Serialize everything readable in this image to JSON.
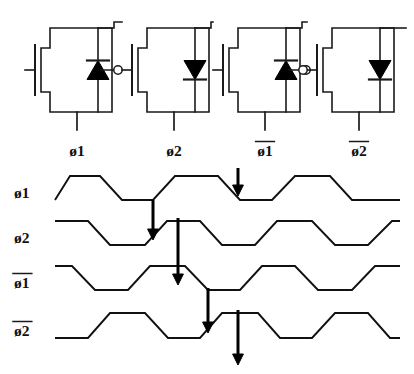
{
  "figure": {
    "background_color": "#ffffff",
    "ink_color": "#111111"
  },
  "circuit": {
    "name": "four-stage-clock-driver",
    "description": "Four cascaded MOS inverter stages with bootstrap diodes",
    "stages": [
      {
        "id": "stage-1",
        "output_label": "ø1",
        "diode_direction": "up",
        "diode_name": "diode-up-icon",
        "has_input_bubble": false,
        "has_output_bubble": true,
        "x": 50
      },
      {
        "id": "stage-2",
        "output_label": "ø2",
        "diode_direction": "down",
        "diode_name": "diode-down-icon",
        "has_input_bubble": false,
        "has_output_bubble": false,
        "x": 147
      },
      {
        "id": "stage-3",
        "output_label": "ø1",
        "output_label_overbar": true,
        "diode_direction": "up",
        "diode_name": "diode-up-icon",
        "has_input_bubble": false,
        "has_output_bubble": true,
        "x": 238
      },
      {
        "id": "stage-4",
        "output_label": "ø2",
        "output_label_overbar": true,
        "diode_direction": "down",
        "diode_name": "diode-down-icon",
        "has_input_bubble": true,
        "has_output_bubble": false,
        "x": 332
      }
    ],
    "labels": {
      "stage1": "ø1",
      "stage2": "ø2",
      "stage3": "ø1",
      "stage4": "ø2"
    }
  },
  "chart_data": {
    "type": "line",
    "xlabel": "",
    "ylabel": "",
    "grid": false,
    "legend": "none",
    "waveform_shape": "trapezoidal",
    "series": [
      {
        "name": "ø1",
        "overbar": false,
        "row": 0,
        "baseline_y": 200,
        "high_y": 176,
        "phase_offset": 0,
        "points": [
          [
            55,
            200
          ],
          [
            70,
            176
          ],
          [
            100,
            176
          ],
          [
            122,
            200
          ],
          [
            153,
            200
          ],
          [
            175,
            176
          ],
          [
            218,
            176
          ],
          [
            240,
            200
          ],
          [
            272,
            200
          ],
          [
            295,
            176
          ],
          [
            330,
            176
          ],
          [
            352,
            200
          ],
          [
            400,
            200
          ]
        ]
      },
      {
        "name": "ø2",
        "overbar": false,
        "row": 1,
        "baseline_y": 245,
        "high_y": 221,
        "phase_offset": 90,
        "points": [
          [
            55,
            221
          ],
          [
            88,
            221
          ],
          [
            110,
            245
          ],
          [
            145,
            245
          ],
          [
            167,
            221
          ],
          [
            200,
            221
          ],
          [
            222,
            245
          ],
          [
            255,
            245
          ],
          [
            277,
            221
          ],
          [
            312,
            221
          ],
          [
            335,
            245
          ],
          [
            368,
            245
          ],
          [
            392,
            221
          ],
          [
            400,
            221
          ]
        ]
      },
      {
        "name": "ø1",
        "overbar": true,
        "row": 2,
        "baseline_y": 290,
        "high_y": 266,
        "phase_offset": 180,
        "points": [
          [
            55,
            266
          ],
          [
            72,
            266
          ],
          [
            95,
            290
          ],
          [
            128,
            290
          ],
          [
            150,
            266
          ],
          [
            185,
            266
          ],
          [
            208,
            290
          ],
          [
            240,
            290
          ],
          [
            262,
            266
          ],
          [
            295,
            266
          ],
          [
            318,
            290
          ],
          [
            352,
            290
          ],
          [
            375,
            266
          ],
          [
            400,
            266
          ]
        ]
      },
      {
        "name": "ø2",
        "overbar": true,
        "row": 3,
        "baseline_y": 338,
        "high_y": 313,
        "phase_offset": 270,
        "points": [
          [
            55,
            338
          ],
          [
            88,
            338
          ],
          [
            110,
            313
          ],
          [
            145,
            313
          ],
          [
            168,
            338
          ],
          [
            200,
            338
          ],
          [
            222,
            313
          ],
          [
            258,
            313
          ],
          [
            280,
            338
          ],
          [
            312,
            338
          ],
          [
            335,
            313
          ],
          [
            368,
            313
          ],
          [
            390,
            338
          ],
          [
            400,
            338
          ]
        ]
      }
    ],
    "annotations": [
      {
        "name": "delay-arrow-1",
        "from_row": 0,
        "to_row": 0,
        "x": 238,
        "y1": 168,
        "y2": 196,
        "description": "arrow marking ø1 falling edge"
      },
      {
        "name": "delay-arrow-2",
        "from_row": 0,
        "to_row": 1,
        "x": 153,
        "y1": 200,
        "y2": 240,
        "description": "ø1 falling edge triggers ø2 falling edge"
      },
      {
        "name": "delay-arrow-3",
        "from_row": 1,
        "to_row": 2,
        "x": 178,
        "y1": 218,
        "y2": 285,
        "description": "ø2 rising edge triggers ø1-bar falling edge"
      },
      {
        "name": "delay-arrow-4",
        "from_row": 2,
        "to_row": 3,
        "x": 208,
        "y1": 288,
        "y2": 333,
        "description": "ø1-bar falling edge triggers ø2-bar rising edge"
      },
      {
        "name": "delay-arrow-5",
        "from_row": 3,
        "to_row": 3,
        "x": 238,
        "y1": 310,
        "y2": 365,
        "description": "ø2-bar edge propagates out"
      }
    ],
    "row_labels": [
      "ø1",
      "ø2",
      "ø1",
      "ø2"
    ]
  }
}
